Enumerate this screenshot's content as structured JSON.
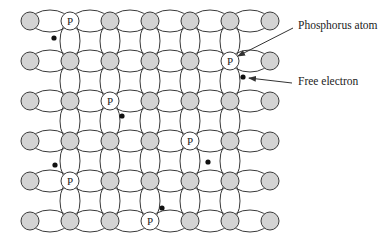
{
  "diagram": {
    "grid": {
      "columns_x": [
        30,
        70,
        110,
        150,
        190,
        230,
        270
      ],
      "rows_y": [
        21,
        61,
        101,
        141,
        181,
        221
      ],
      "atom_radius": 9,
      "vertical_bond_columns": [
        1,
        2,
        3,
        4,
        5
      ]
    },
    "colors": {
      "atom_fill": "#d3d3d3",
      "phosphorus_fill": "#ffffff",
      "stroke": "#3a3a3a",
      "electron": "#111111"
    },
    "phosphorus_atoms": [
      {
        "row": 0,
        "col": 1,
        "label": "P"
      },
      {
        "row": 1,
        "col": 5,
        "label": "P"
      },
      {
        "row": 2,
        "col": 2,
        "label": "P"
      },
      {
        "row": 3,
        "col": 4,
        "label": "P"
      },
      {
        "row": 4,
        "col": 1,
        "label": "P"
      },
      {
        "row": 5,
        "col": 3,
        "label": "P"
      }
    ],
    "free_electrons": [
      {
        "x": 54,
        "y": 38
      },
      {
        "x": 243,
        "y": 77
      },
      {
        "x": 122,
        "y": 116
      },
      {
        "x": 208,
        "y": 162
      },
      {
        "x": 55,
        "y": 165
      },
      {
        "x": 162,
        "y": 208
      }
    ],
    "annotations": [
      {
        "text": "Phosphorus atom",
        "x": 298,
        "y": 19,
        "arrow_from": [
          293,
          28
        ],
        "arrow_to": [
          238,
          56
        ]
      },
      {
        "text": "Free electron",
        "x": 298,
        "y": 75,
        "arrow_from": [
          292,
          83
        ],
        "arrow_to": [
          249,
          78
        ]
      }
    ]
  }
}
